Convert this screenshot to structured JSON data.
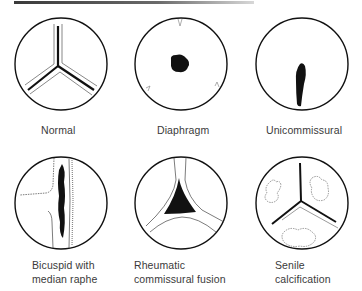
{
  "figure": {
    "panels": [
      {
        "id": "normal",
        "label_lines": [
          "Normal"
        ]
      },
      {
        "id": "diaphragm",
        "label_lines": [
          "Diaphragm"
        ]
      },
      {
        "id": "unicommissural",
        "label_lines": [
          "Unicommissural"
        ]
      },
      {
        "id": "bicuspid",
        "label_lines": [
          "Bicuspid with",
          "median raphe"
        ]
      },
      {
        "id": "rheumatic",
        "label_lines": [
          "Rheumatic",
          "commissural fusion"
        ]
      },
      {
        "id": "senile",
        "label_lines": [
          "Senile",
          "calcification"
        ]
      }
    ],
    "colors": {
      "ink": "#111111",
      "label": "#3a3a3a",
      "background": "#ffffff"
    }
  }
}
